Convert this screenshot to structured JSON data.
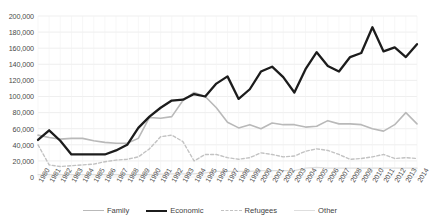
{
  "chart_data": {
    "type": "line",
    "title": "",
    "xlabel": "",
    "ylabel": "",
    "ylim": [
      0,
      200000
    ],
    "ytick_step": 20000,
    "grid": true,
    "legend_position": "bottom",
    "ytick_labels": [
      "200,000",
      "180,000",
      "160,000",
      "140,000",
      "120,000",
      "100,000",
      "80,000",
      "60,000",
      "40,000",
      "20,000",
      "0"
    ],
    "categories": [
      "1980",
      "1981",
      "1982",
      "1983",
      "1984",
      "1985",
      "1986",
      "1987",
      "1988",
      "1989",
      "1990",
      "1991",
      "1992",
      "1993",
      "1994",
      "1995",
      "1996",
      "1997",
      "1998",
      "1999",
      "2000",
      "2001",
      "2002",
      "2003",
      "2004",
      "2005",
      "2006",
      "2007",
      "2008",
      "2009",
      "2010",
      "2011",
      "2012",
      "2013",
      "2014"
    ],
    "series": [
      {
        "name": "Family",
        "color": "#b9b9b9",
        "style": "solid",
        "width": 1.6,
        "values": [
          52000,
          49000,
          47000,
          48000,
          48000,
          45000,
          43000,
          42000,
          42000,
          48000,
          74000,
          73000,
          75000,
          95000,
          105000,
          100000,
          86000,
          68000,
          61000,
          65000,
          60000,
          67000,
          65000,
          65000,
          62000,
          63000,
          70000,
          66000,
          66000,
          65000,
          60000,
          57000,
          65000,
          80000,
          66000
        ]
      },
      {
        "name": "Economic",
        "color": "#1c1c1c",
        "style": "solid",
        "width": 2.3,
        "values": [
          46000,
          58000,
          45000,
          28000,
          28000,
          28000,
          28000,
          33000,
          40000,
          61000,
          75000,
          86000,
          95000,
          96000,
          103000,
          100000,
          116000,
          125000,
          97000,
          109000,
          131000,
          137000,
          124000,
          105000,
          134000,
          155000,
          138000,
          131000,
          149000,
          154000,
          186000,
          156000,
          161000,
          149000,
          165000
        ]
      },
      {
        "name": "Refugees",
        "color": "#c2c2c2",
        "style": "dashed",
        "width": 1.4,
        "values": [
          40000,
          15000,
          13000,
          14000,
          15000,
          16000,
          19000,
          21000,
          22000,
          25000,
          35000,
          50000,
          52000,
          44000,
          20000,
          28000,
          28000,
          24000,
          22000,
          24000,
          30000,
          28000,
          25000,
          26000,
          32000,
          35000,
          33000,
          28000,
          22000,
          23000,
          25000,
          28000,
          23000,
          24000,
          23000
        ]
      },
      {
        "name": "Other",
        "color": "#dedede",
        "style": "solid",
        "width": 1.3,
        "values": [
          3000,
          3000,
          3000,
          3000,
          3000,
          3000,
          3000,
          3000,
          3000,
          3000,
          3000,
          3500,
          4000,
          4000,
          4000,
          5000,
          7000,
          7000,
          7000,
          7000,
          8000,
          8000,
          8000,
          8000,
          11000,
          12000,
          11000,
          11000,
          11000,
          11000,
          11000,
          11000,
          11000,
          11000,
          11000
        ]
      }
    ]
  }
}
